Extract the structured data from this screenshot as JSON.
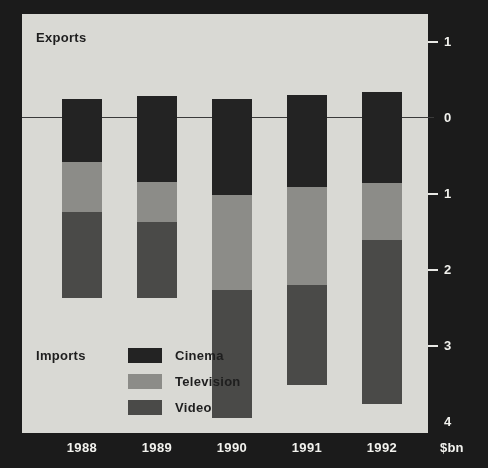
{
  "chart_data": {
    "type": "bar",
    "subtype": "stacked-diverging",
    "title": "",
    "xlabel": "",
    "ylabel": "$bn",
    "unit_label": "$bn",
    "categories": [
      "1988",
      "1989",
      "1990",
      "1991",
      "1992"
    ],
    "axis_ticks": [
      {
        "label": "1",
        "value": 1
      },
      {
        "label": "0",
        "value": 0
      },
      {
        "label": "1",
        "value": -1
      },
      {
        "label": "2",
        "value": -2
      },
      {
        "label": "3",
        "value": -3
      },
      {
        "label": "4",
        "value": -4
      }
    ],
    "ylim": [
      -4,
      1
    ],
    "grid": false,
    "legend_position": "inside-bottom-left",
    "direction_labels": {
      "positive": "Exports",
      "negative": "Imports"
    },
    "series": [
      {
        "name": "Cinema",
        "color": "#232323",
        "side": "imports",
        "values": [
          0.59,
          0.85,
          1.03,
          0.92,
          0.87
        ]
      },
      {
        "name": "Television",
        "color": "#8c8c88",
        "side": "imports",
        "values": [
          0.66,
          0.53,
          1.25,
          1.29,
          0.75
        ]
      },
      {
        "name": "Video",
        "color": "#4a4a48",
        "side": "imports",
        "values": [
          1.13,
          1.0,
          1.68,
          1.32,
          2.16
        ]
      },
      {
        "name": "Exports",
        "color": "#232323",
        "side": "exports",
        "values": [
          0.24,
          0.27,
          0.24,
          0.29,
          0.33
        ]
      }
    ],
    "import_totals": [
      2.38,
      2.38,
      3.96,
      3.53,
      3.78
    ]
  },
  "legend": {
    "items": [
      {
        "label": "Cinema"
      },
      {
        "label": "Television"
      },
      {
        "label": "Video"
      }
    ]
  }
}
